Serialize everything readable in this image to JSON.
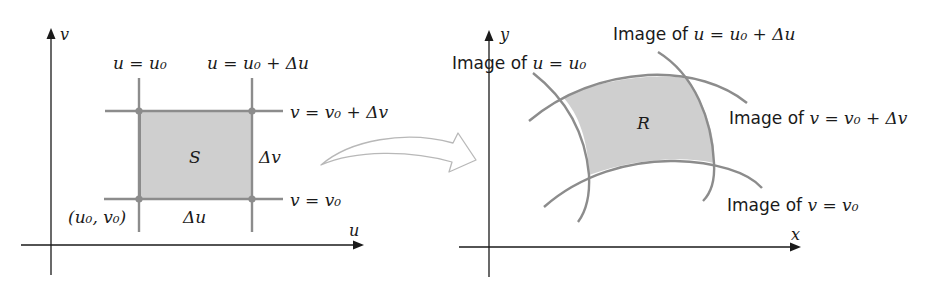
{
  "left_panel": {
    "axis_vertical_label": "v",
    "axis_horizontal_label": "u",
    "line_u0_label": "u = u₀",
    "line_u0_du_label": "u = u₀ + Δu",
    "line_v0_dv_label": "v = v₀ + Δv",
    "line_v0_label": "v = v₀",
    "region_label": "S",
    "delta_v_label": "Δv",
    "delta_u_label": "Δu",
    "corner_point_label": "(u₀, v₀)"
  },
  "right_panel": {
    "axis_vertical_label": "y",
    "axis_horizontal_label": "x",
    "image_u0_label_prefix": "Image of ",
    "image_u0_label_math": "u = u₀",
    "image_u0_du_label_prefix": "Image of ",
    "image_u0_du_label_math": "u = u₀ + Δu",
    "image_v0_dv_label_prefix": "Image of ",
    "image_v0_dv_label_math": "v = v₀ + Δv",
    "image_v0_label_prefix": "Image of ",
    "image_v0_label_math": "v = v₀",
    "region_label": "R"
  },
  "transform_arrow": {
    "icon": "curved-hollow-arrow"
  },
  "colors": {
    "shading": "#cfcfcf",
    "grid_lines": "#8c8c8c",
    "axes": "#1a1a1a",
    "arrow_outline": "#b8b8b8"
  }
}
